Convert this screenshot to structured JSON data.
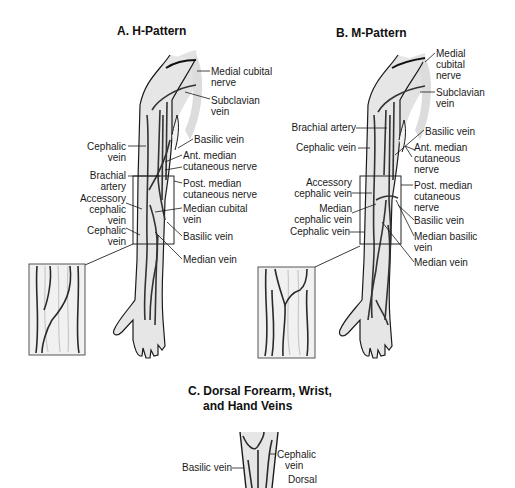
{
  "panels": {
    "a": {
      "title": "A. H-Pattern",
      "labels": {
        "medial_cubital_nerve_1": "Medial cubital",
        "medial_cubital_nerve_2": "nerve",
        "subclavian_1": "Subclavian",
        "subclavian_2": "vein",
        "cephalic_1": "Cephalic",
        "cephalic_2": "vein",
        "basilic_upper": "Basilic vein",
        "ant_median_1": "Ant. median",
        "ant_median_2": "cutaneous nerve",
        "brachial_1": "Brachial",
        "brachial_2": "artery",
        "post_median_1": "Post. median",
        "post_median_2": "cutaneous nerve",
        "accessory_1": "Accessory",
        "accessory_2": "cephalic",
        "accessory_3": "vein",
        "median_cubital_1": "Median cubital",
        "median_cubital_2": "vein",
        "cephalic_lower_1": "Cephalic",
        "cephalic_lower_2": "vein",
        "basilic_lower": "Basilic vein",
        "median_vein": "Median vein"
      }
    },
    "b": {
      "title": "B. M-Pattern",
      "labels": {
        "medial_cubital_1": "Medial",
        "medial_cubital_2": "cubital",
        "medial_cubital_3": "nerve",
        "subclavian_1": "Subclavian",
        "subclavian_2": "vein",
        "brachial_artery": "Brachial artery",
        "basilic_upper": "Basilic vein",
        "cephalic_upper": "Cephalic vein",
        "ant_median_1": "Ant. median",
        "ant_median_2": "cutaneous",
        "ant_median_3": "nerve",
        "accessory_1": "Accessory",
        "accessory_2": "cephalic vein",
        "post_median_1": "Post. median",
        "post_median_2": "cutaneous",
        "post_median_3": "nerve",
        "median_cephalic_1": "Median",
        "median_cephalic_2": "cephalic vein",
        "basilic_lower": "Basilic vein",
        "cephalic_lower": "Cephalic vein",
        "median_basilic_1": "Median basilic",
        "median_basilic_2": "vein",
        "median_vein": "Median vein"
      }
    },
    "c": {
      "title_1": "C. Dorsal Forearm, Wrist,",
      "title_2": "and Hand Veins",
      "labels": {
        "basilic": "Basilic vein",
        "cephalic_1": "Cephalic",
        "cephalic_2": "vein",
        "dorsal": "Dorsal"
      }
    }
  },
  "colors": {
    "line": "#1a1a1a",
    "vein": "#3a3a3a",
    "skin": "#e4e4e4",
    "shadow": "#d6d6d6"
  }
}
